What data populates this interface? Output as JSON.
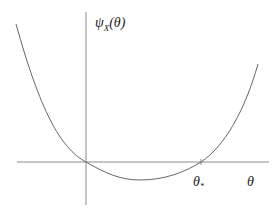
{
  "diagram": {
    "y_axis_label": "ψX(θ)",
    "y_axis_label_main": "ψ",
    "y_axis_label_sub": "X",
    "y_axis_label_arg": "(θ)",
    "x_axis_label": "θ",
    "root_label_main": "θ",
    "root_label_sub": "*",
    "curve_description": "convex function through origin, dipping below the axis, crossing zero again at θ*",
    "colors": {
      "axes": "#777777",
      "curve": "#666666",
      "text": "#222222"
    }
  }
}
